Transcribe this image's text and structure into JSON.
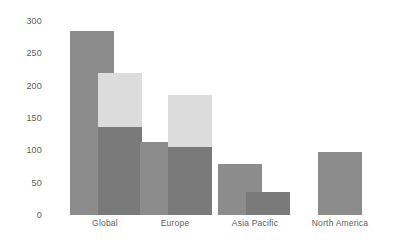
{
  "chart_data": {
    "type": "bar",
    "title": "",
    "subtitle": "",
    "xlabel": "",
    "ylabel": "",
    "ylim": [
      0,
      300
    ],
    "grid": false,
    "legend": "none",
    "y_ticks": [
      300,
      250,
      200,
      150,
      100,
      50,
      0
    ],
    "y_tick_labels": [
      "300",
      "250",
      "200",
      "150",
      "100",
      "50",
      "0"
    ],
    "categories": [
      "Global",
      "Europe",
      "Asia Pacific",
      "North America"
    ],
    "series": [
      {
        "name": "series-1",
        "color": "#8c8c8c",
        "values": [
          284,
          113,
          79,
          97
        ]
      },
      {
        "name": "series-2",
        "color": "#dcdcdc",
        "values": [
          220,
          185,
          null,
          null
        ]
      },
      {
        "name": "series-3",
        "color": "#7a7a7a",
        "values": [
          136,
          105,
          36,
          null
        ]
      }
    ],
    "bars": [
      {
        "group": "Global",
        "layer": 1,
        "value": 284,
        "color": "#8c8c8c"
      },
      {
        "group": "Global",
        "layer": 2,
        "value": 220,
        "color": "#dcdcdc"
      },
      {
        "group": "Global",
        "layer": 3,
        "value": 136,
        "color": "#7a7a7a"
      },
      {
        "group": "Europe",
        "layer": 1,
        "value": 113,
        "color": "#8c8c8c"
      },
      {
        "group": "Europe",
        "layer": 2,
        "value": 185,
        "color": "#dcdcdc"
      },
      {
        "group": "Europe",
        "layer": 3,
        "value": 105,
        "color": "#7a7a7a"
      },
      {
        "group": "Asia Pacific",
        "layer": 1,
        "value": 79,
        "color": "#8c8c8c"
      },
      {
        "group": "Asia Pacific",
        "layer": 3,
        "value": 36,
        "color": "#7a7a7a"
      },
      {
        "group": "North America",
        "layer": 1,
        "value": 97,
        "color": "#8c8c8c"
      }
    ]
  },
  "axis": {
    "tick_0": "0",
    "tick_50": "50",
    "tick_100": "100",
    "tick_150": "150",
    "tick_200": "200",
    "tick_250": "250",
    "tick_300": "300"
  },
  "categories": {
    "global": "Global",
    "europe": "Europe",
    "asia_pacific": "Asia Pacific",
    "north_america": "North America"
  },
  "colors": {
    "bar_mid_gray": "#8c8c8c",
    "bar_light_gray": "#dcdcdc",
    "bar_dark_gray": "#7a7a7a",
    "axis_text": "#5c5c5c",
    "background": "#ffffff"
  }
}
